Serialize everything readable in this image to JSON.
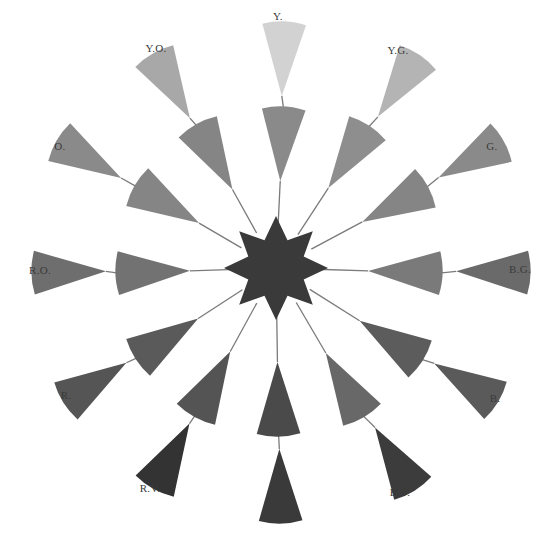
{
  "diagram": {
    "type": "color-wheel-star",
    "center": {
      "x": 276,
      "y": 268
    },
    "star": {
      "points": 8,
      "outer_r": 52,
      "inner_r": 30,
      "color": "#3a3a3a"
    },
    "colors": {
      "stem": "#7a7a7a",
      "label": "#3a3a3a",
      "background": "#ffffff"
    },
    "spokes": [
      {
        "id": "Y",
        "label": "Y.",
        "label_x": 278,
        "label_y": 20,
        "outer": {
          "cx": 283,
          "cy": 60,
          "rot": 180,
          "color": "#d2d2d2"
        },
        "inner": {
          "cx": 282,
          "cy": 145,
          "rot": 180,
          "color": "#8a8a8a"
        }
      },
      {
        "id": "YG",
        "label": "Y.G.",
        "label_x": 398,
        "label_y": 54,
        "outer": {
          "cx": 398,
          "cy": 87,
          "rot": 210,
          "color": "#b4b4b4"
        },
        "inner": {
          "cx": 348,
          "cy": 158,
          "rot": 210,
          "color": "#8e8e8e"
        }
      },
      {
        "id": "G",
        "label": "G.",
        "label_x": 492,
        "label_y": 150,
        "outer": {
          "cx": 470,
          "cy": 160,
          "rot": 240,
          "color": "#8a8a8a"
        },
        "inner": {
          "cx": 394,
          "cy": 205,
          "rot": 240,
          "color": "#858585"
        }
      },
      {
        "id": "BG",
        "label": "B.G.",
        "label_x": 520,
        "label_y": 273,
        "outer": {
          "cx": 492,
          "cy": 272,
          "rot": 270,
          "color": "#6a6a6a"
        },
        "inner": {
          "cx": 404,
          "cy": 272,
          "rot": 270,
          "color": "#7a7a7a"
        }
      },
      {
        "id": "B",
        "label": "B.",
        "label_x": 495,
        "label_y": 402,
        "outer": {
          "cx": 465,
          "cy": 382,
          "rot": 300,
          "color": "#5a5a5a"
        },
        "inner": {
          "cx": 390,
          "cy": 340,
          "rot": 300,
          "color": "#5c5c5c"
        }
      },
      {
        "id": "BV",
        "label": "B.V.",
        "label_x": 400,
        "label_y": 496,
        "outer": {
          "cx": 394,
          "cy": 458,
          "rot": 330,
          "color": "#3c3c3c"
        },
        "inner": {
          "cx": 344,
          "cy": 384,
          "rot": 330,
          "color": "#686868"
        }
      },
      {
        "id": "V",
        "label": "V.",
        "label_x": 280,
        "label_y": 523,
        "outer": {
          "cx": 280,
          "cy": 485,
          "rot": 0,
          "color": "#3a3a3a"
        },
        "inner": {
          "cx": 278,
          "cy": 398,
          "rot": 0,
          "color": "#4a4a4a"
        }
      },
      {
        "id": "RV",
        "label": "R.V.",
        "label_x": 150,
        "label_y": 492,
        "outer": {
          "cx": 172,
          "cy": 455,
          "rot": 30,
          "color": "#333333"
        },
        "inner": {
          "cx": 213,
          "cy": 383,
          "rot": 30,
          "color": "#545454"
        }
      },
      {
        "id": "R",
        "label": "R.",
        "label_x": 66,
        "label_y": 399,
        "outer": {
          "cx": 96,
          "cy": 382,
          "rot": 60,
          "color": "#555555"
        },
        "inner": {
          "cx": 168,
          "cy": 338,
          "rot": 60,
          "color": "#5a5a5a"
        }
      },
      {
        "id": "RO",
        "label": "R.O.",
        "label_x": 40,
        "label_y": 274,
        "outer": {
          "cx": 70,
          "cy": 272,
          "rot": 90,
          "color": "#6e6e6e"
        },
        "inner": {
          "cx": 154,
          "cy": 272,
          "rot": 90,
          "color": "#727272"
        }
      },
      {
        "id": "O",
        "label": "O.",
        "label_x": 60,
        "label_y": 150,
        "outer": {
          "cx": 90,
          "cy": 160,
          "rot": 120,
          "color": "#8a8a8a"
        },
        "inner": {
          "cx": 168,
          "cy": 205,
          "rot": 120,
          "color": "#858585"
        }
      },
      {
        "id": "YO",
        "label": "Y.O.",
        "label_x": 156,
        "label_y": 52,
        "outer": {
          "cx": 172,
          "cy": 87,
          "rot": 150,
          "color": "#a8a8a8"
        },
        "inner": {
          "cx": 215,
          "cy": 158,
          "rot": 150,
          "color": "#858585"
        }
      }
    ]
  }
}
